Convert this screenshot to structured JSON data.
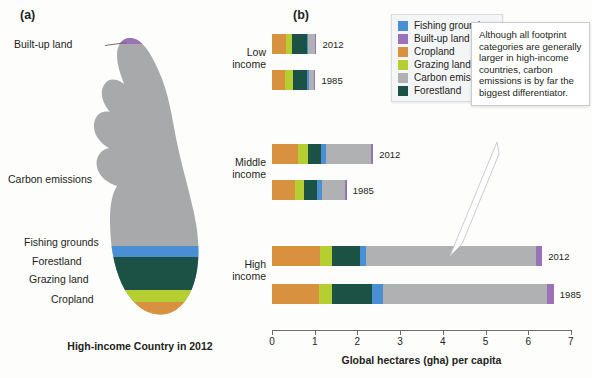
{
  "panels": {
    "a": {
      "letter": "(a)",
      "caption": "High-income Country in 2012"
    },
    "b": {
      "letter": "(b)"
    }
  },
  "foot_labels": {
    "built_up": "Built-up land",
    "carbon": "Carbon emissions",
    "fishing": "Fishing grounds",
    "forestland": "Forestland",
    "grazing": "Grazing land",
    "cropland": "Cropland"
  },
  "legend": {
    "items": [
      {
        "label": "Fishing grounds",
        "color": "#4a8ed4"
      },
      {
        "label": "Built-up land",
        "color": "#9b72b8"
      },
      {
        "label": "Cropland",
        "color": "#d8913f"
      },
      {
        "label": "Grazing land",
        "color": "#b5cf32"
      },
      {
        "label": "Carbon emissions",
        "color": "#b0b1b3"
      },
      {
        "label": "Forestland",
        "color": "#1b5245"
      }
    ]
  },
  "callout": {
    "text": "Although all footprint categories are generally larger in high-income countries, carbon emissions is by far the biggest differentiator."
  },
  "chart_data": {
    "type": "bar",
    "orientation": "horizontal",
    "stacked": true,
    "title": "",
    "xlabel": "Global hectares (gha) per capita",
    "ylabel": "",
    "xlim": [
      0,
      7
    ],
    "xticks": [
      0,
      1,
      2,
      3,
      4,
      5,
      6,
      7
    ],
    "grid": false,
    "legend_position": "top-right",
    "categories": [
      "Low income",
      "Middle income",
      "High income"
    ],
    "series": [
      {
        "name": "Cropland",
        "color": "#d8913f"
      },
      {
        "name": "Grazing land",
        "color": "#b5cf32"
      },
      {
        "name": "Forestland",
        "color": "#1b5245"
      },
      {
        "name": "Fishing grounds",
        "color": "#4a8ed4"
      },
      {
        "name": "Carbon emissions",
        "color": "#b0b1b3"
      },
      {
        "name": "Built-up land",
        "color": "#9b72b8"
      }
    ],
    "bars": [
      {
        "group": "Low income",
        "year": "2012",
        "total": 1.04,
        "values": {
          "Cropland": 0.33,
          "Grazing land": 0.13,
          "Forestland": 0.35,
          "Fishing grounds": 0.03,
          "Carbon emissions": 0.17,
          "Built-up land": 0.03
        }
      },
      {
        "group": "Low income",
        "year": "1985",
        "total": 1.02,
        "values": {
          "Cropland": 0.3,
          "Grazing land": 0.2,
          "Forestland": 0.33,
          "Fishing grounds": 0.03,
          "Carbon emissions": 0.13,
          "Built-up land": 0.03
        }
      },
      {
        "group": "Middle income",
        "year": "2012",
        "total": 2.37,
        "values": {
          "Cropland": 0.62,
          "Grazing land": 0.22,
          "Forestland": 0.3,
          "Fishing grounds": 0.13,
          "Carbon emissions": 1.05,
          "Built-up land": 0.05
        }
      },
      {
        "group": "Middle income",
        "year": "1985",
        "total": 1.75,
        "values": {
          "Cropland": 0.55,
          "Grazing land": 0.2,
          "Forestland": 0.3,
          "Fishing grounds": 0.12,
          "Carbon emissions": 0.54,
          "Built-up land": 0.04
        }
      },
      {
        "group": "High income",
        "year": "2012",
        "total": 6.33,
        "values": {
          "Cropland": 1.13,
          "Grazing land": 0.28,
          "Forestland": 0.64,
          "Fishing grounds": 0.15,
          "Carbon emissions": 3.98,
          "Built-up land": 0.15
        }
      },
      {
        "group": "High income",
        "year": "1985",
        "total": 6.6,
        "values": {
          "Cropland": 1.1,
          "Grazing land": 0.3,
          "Forestland": 0.95,
          "Fishing grounds": 0.25,
          "Carbon emissions": 3.85,
          "Built-up land": 0.15
        }
      }
    ]
  }
}
